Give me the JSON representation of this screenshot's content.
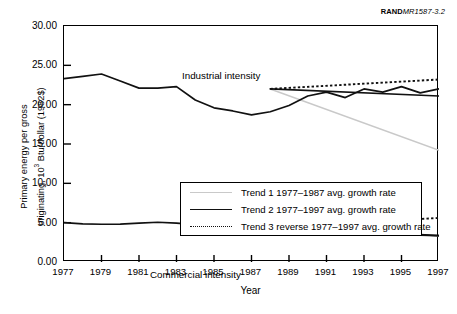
{
  "credit": {
    "org": "RAND",
    "doc_id": "MR1587-3.2"
  },
  "chart_data": {
    "type": "line",
    "title": "",
    "xlabel": "Year",
    "ylabel": "Primary energy per gross originating, 10³ Btu/dollar (1982$)",
    "ylabel_line1": "Primary energy per gross",
    "ylabel_line2_pre": "originating, 10",
    "ylabel_line2_sup": "3",
    "ylabel_line2_post": " Btu/dollar (1982$)",
    "xlim": [
      1977,
      1997
    ],
    "ylim": [
      0,
      30
    ],
    "ytick_labels": [
      "30.00",
      "25.00",
      "20.00",
      "15.00",
      "10.00",
      "5.00",
      "0.00"
    ],
    "ytick_values": [
      30,
      25,
      20,
      15,
      10,
      5,
      0
    ],
    "xtick_labels": [
      "1977",
      "1979",
      "1981",
      "1983",
      "1985",
      "1987",
      "1989",
      "1991",
      "1993",
      "1995",
      "1997"
    ],
    "xtick_values": [
      1977,
      1979,
      1981,
      1983,
      1985,
      1987,
      1989,
      1991,
      1993,
      1995,
      1997
    ],
    "grid": false,
    "legend_position": "inside-center",
    "annotations": [
      {
        "text": "Industrial intensity",
        "x": 1980.4,
        "y": 26.2
      },
      {
        "text": "Commercial intensity",
        "x": 1978.6,
        "y": 3.9
      }
    ],
    "colors": {
      "trend1": "#c9c9c9",
      "trend2": "#111111",
      "trend3": "#111111",
      "data_line": "#111111",
      "axis": "#000000"
    },
    "x": [
      1977,
      1978,
      1979,
      1980,
      1981,
      1982,
      1983,
      1984,
      1985,
      1986,
      1987,
      1988,
      1989,
      1990,
      1991,
      1992,
      1993,
      1994,
      1995,
      1996,
      1997
    ],
    "series": [
      {
        "name": "Industrial intensity",
        "style": "solid",
        "color": "#111111",
        "values": [
          23.3,
          23.6,
          23.9,
          23.0,
          22.1,
          22.1,
          22.3,
          20.6,
          19.6,
          19.2,
          18.7,
          19.1,
          19.9,
          21.1,
          21.6,
          20.9,
          22.0,
          21.6,
          22.3,
          21.5,
          22.0
        ]
      },
      {
        "name": "Commercial intensity",
        "style": "solid",
        "color": "#111111",
        "values": [
          5.0,
          4.85,
          4.8,
          4.82,
          4.95,
          5.05,
          4.95,
          4.75,
          4.55,
          4.45,
          4.48,
          4.5,
          4.35,
          4.15,
          3.95,
          3.8,
          3.7,
          3.55,
          3.45,
          3.4,
          3.35
        ]
      }
    ],
    "trend_segments": [
      {
        "name": "Trend 1 1977–1987 avg. growth rate",
        "applies_to": "Industrial intensity",
        "style": "solid",
        "color": "#c9c9c9",
        "x": [
          1988,
          1997
        ],
        "y": [
          22.0,
          14.2
        ]
      },
      {
        "name": "Trend 2 1977–1997 avg. growth rate",
        "applies_to": "Industrial intensity",
        "style": "solid",
        "color": "#111111",
        "x": [
          1988,
          1997
        ],
        "y": [
          22.0,
          21.1
        ]
      },
      {
        "name": "Trend 3 reverse 1977–1997 avg. growth rate",
        "applies_to": "Industrial intensity",
        "style": "dotted",
        "color": "#111111",
        "x": [
          1988,
          1997
        ],
        "y": [
          22.0,
          23.2
        ]
      },
      {
        "name": "Trend 1 1977–1987 avg. growth rate",
        "applies_to": "Commercial intensity",
        "style": "solid",
        "color": "#c9c9c9",
        "x": [
          1988,
          1997
        ],
        "y": [
          4.5,
          3.3
        ]
      },
      {
        "name": "Trend 2 1977–1997 avg. growth rate",
        "applies_to": "Commercial intensity",
        "style": "solid",
        "color": "#111111",
        "x": [
          1988,
          1997
        ],
        "y": [
          4.5,
          3.35
        ]
      },
      {
        "name": "Trend 3 reverse 1977–1997 avg. growth rate",
        "applies_to": "Commercial intensity",
        "style": "dotted",
        "color": "#111111",
        "x": [
          1988,
          1997
        ],
        "y": [
          4.5,
          5.6
        ]
      }
    ],
    "legend": [
      {
        "label": "Trend 1 1977–1987 avg. growth rate",
        "style": "solid",
        "color": "#c9c9c9"
      },
      {
        "label": "Trend 2 1977–1997 avg. growth rate",
        "style": "solid",
        "color": "#111111"
      },
      {
        "label": "Trend 3 reverse 1977–1997 avg. growth rate",
        "style": "dotted",
        "color": "#111111"
      }
    ]
  }
}
